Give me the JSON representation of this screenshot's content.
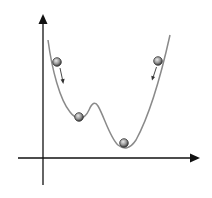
{
  "diagram": {
    "type": "potential-energy-landscape",
    "colors": {
      "axis": "#111111",
      "curve": "#8a8a8a",
      "ball_fill": "#9a9a9a",
      "ball_stroke": "#333333",
      "arrow": "#333333",
      "background": "#ffffff"
    },
    "axes": {
      "x_axis": {
        "label": ""
      },
      "y_axis": {
        "label": ""
      }
    },
    "balls": [
      {
        "id": "left-high",
        "role": "rolling-down",
        "x": 57,
        "y": 62
      },
      {
        "id": "local-min",
        "role": "local-minimum",
        "x": 79,
        "y": 117
      },
      {
        "id": "global-min",
        "role": "global-minimum",
        "x": 124,
        "y": 143
      },
      {
        "id": "right-high",
        "role": "rolling-down",
        "x": 158,
        "y": 61
      }
    ],
    "arrows": [
      {
        "id": "left-arrow",
        "from": [
          60,
          68
        ],
        "to": [
          63,
          84
        ]
      },
      {
        "id": "right-arrow",
        "from": [
          156,
          68
        ],
        "to": [
          152,
          80
        ]
      }
    ]
  }
}
